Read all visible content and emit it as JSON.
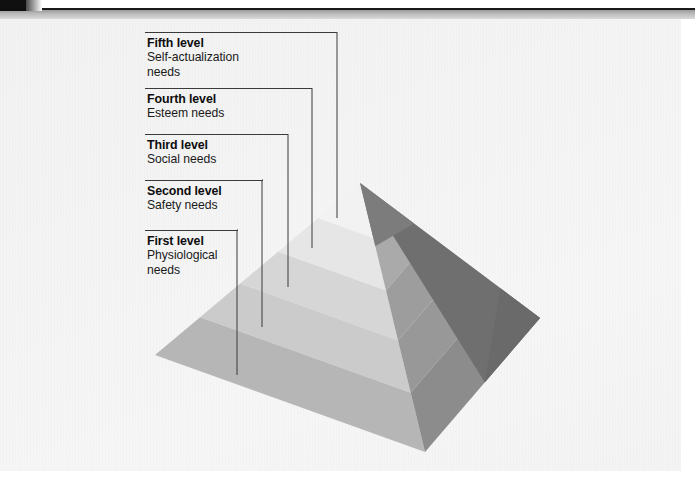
{
  "figure": {
    "type": "pyramid-diagram",
    "background_color": "#f3f3f3",
    "header_rule_color": "#1a1a1a"
  },
  "levels": [
    {
      "id": "level-5",
      "title": "Fifth level",
      "description": "Self-actualization\nneeds",
      "desc_line1": "Self-actualization",
      "desc_line2": "needs",
      "rank": 5,
      "label_x": 147,
      "label_y": 36,
      "rule_x": 145,
      "rule_y": 32,
      "rule_width": 192,
      "leader_x": 337,
      "leader_end_y": 218,
      "band_fill_left": "#f0f0f0",
      "band_fill_right": "#8e8e8e"
    },
    {
      "id": "level-4",
      "title": "Fourth level",
      "description": "Esteem needs",
      "desc_line1": "Esteem needs",
      "desc_line2": "",
      "rank": 4,
      "label_x": 147,
      "label_y": 92,
      "rule_x": 145,
      "rule_y": 88,
      "rule_width": 167,
      "leader_x": 312,
      "leader_end_y": 248,
      "band_fill_left": "#e4e4e4",
      "band_fill_right": "#a8a8a8"
    },
    {
      "id": "level-3",
      "title": "Third level",
      "description": "Social needs",
      "desc_line1": "Social needs",
      "desc_line2": "",
      "rank": 3,
      "label_x": 147,
      "label_y": 138,
      "rule_x": 145,
      "rule_y": 134,
      "rule_width": 143,
      "leader_x": 288,
      "leader_end_y": 287,
      "band_fill_left": "#d4d4d4",
      "band_fill_right": "#9b9b9b"
    },
    {
      "id": "level-2",
      "title": "Second level",
      "description": "Safety needs",
      "desc_line1": "Safety needs",
      "desc_line2": "",
      "rank": 2,
      "label_x": 147,
      "label_y": 184,
      "rule_x": 145,
      "rule_y": 180,
      "rule_width": 118,
      "leader_x": 262,
      "leader_end_y": 327,
      "band_fill_left": "#c9c9c9",
      "band_fill_right": "#969696"
    },
    {
      "id": "level-1",
      "title": "First level",
      "description": "Physiological\nneeds",
      "desc_line1": "Physiological",
      "desc_line2": "needs",
      "rank": 1,
      "label_x": 147,
      "label_y": 234,
      "rule_x": 145,
      "rule_y": 230,
      "rule_width": 93,
      "leader_x": 237,
      "leader_end_y": 375,
      "band_fill_left": "#b4b4b4",
      "band_fill_right": "#8a8a8a"
    }
  ],
  "geometry": {
    "apex_x": 360,
    "apex_y": 183,
    "left_corner_x": 155,
    "left_corner_y": 355,
    "front_corner_x": 425,
    "front_corner_y": 452,
    "right_corner_x": 540,
    "right_corner_y": 318,
    "back_corner_x": 470,
    "back_corner_y": 232
  },
  "colors": {
    "left_face_bands": [
      "#f2f2f2",
      "#e6e6e6",
      "#d6d6d6",
      "#cbcbcb",
      "#b6b6b6"
    ],
    "right_face_bands": [
      "#8d8d8d",
      "#aaaaaa",
      "#9d9d9d",
      "#989898",
      "#8c8c8c"
    ],
    "dark_side": "#6f6f6f",
    "apex_dark": "#7c7c7c",
    "leader_line": "#3a3a3a"
  }
}
